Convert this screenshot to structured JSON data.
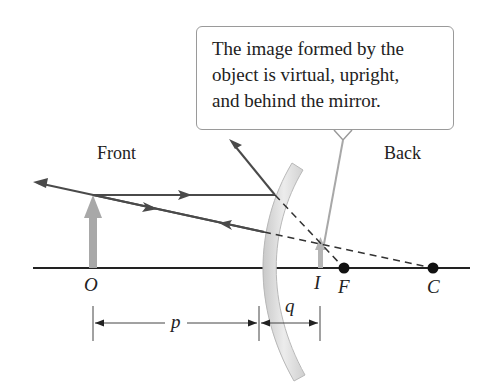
{
  "callout": {
    "lines": [
      "The image formed by the",
      "object is virtual, upright,",
      "and behind the mirror."
    ]
  },
  "regions": {
    "front": "Front",
    "back": "Back"
  },
  "points": {
    "object": "O",
    "image": "I",
    "focal": "F",
    "center": "C"
  },
  "distances": {
    "object_distance": "p",
    "image_distance": "q"
  },
  "colors": {
    "ray": "#4a4a4a",
    "axis": "#222222",
    "object_arrow": "#a8a8a8",
    "mirror_fill": "#dcdcdc",
    "mirror_edge": "#b8b8b8",
    "callout_border": "#9a9a9a"
  },
  "mirror": {
    "type": "convex",
    "description": "Convex mirror forming a virtual, upright, reduced image behind the mirror"
  }
}
